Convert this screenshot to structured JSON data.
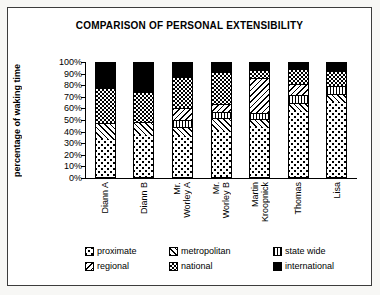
{
  "chart_data": {
    "type": "bar",
    "stacked": true,
    "title": "COMPARISON OF PERSONAL EXTENSIBILITY",
    "ylabel": "percentage of waking time",
    "ylim": [
      0,
      100
    ],
    "ytick_labels": [
      "0%",
      "10%",
      "20%",
      "30%",
      "40%",
      "50%",
      "60%",
      "70%",
      "80%",
      "90%",
      "100%"
    ],
    "grid": false,
    "legend_position": "bottom",
    "legend_columns": 3,
    "categories": [
      "Diann A",
      "Diann B",
      "Mr. Worley A",
      "Mr. Worley B",
      "Martin Kroopnick",
      "Thomas",
      "Lisa"
    ],
    "category_display": [
      "Diann A",
      "Diann B",
      "Mr.\nWorley A",
      "Mr.\nWorley B",
      "Martin\nKroopnick",
      "Thomas",
      "Lisa"
    ],
    "series": [
      {
        "name": "proximate",
        "pattern": "dots",
        "values": [
          33,
          37,
          36,
          40,
          44,
          58,
          66
        ]
      },
      {
        "name": "metropolitan",
        "pattern": "backslash-hatch",
        "values": [
          14,
          11,
          8,
          12,
          7,
          7,
          7
        ]
      },
      {
        "name": "state wide",
        "pattern": "vertical-lines",
        "values": [
          0,
          0,
          6,
          5,
          5,
          7,
          7
        ]
      },
      {
        "name": "regional",
        "pattern": "slash-hatch",
        "values": [
          0,
          0,
          11,
          7,
          31,
          10,
          0
        ]
      },
      {
        "name": "national",
        "pattern": "checker",
        "values": [
          31,
          27,
          27,
          28,
          7,
          13,
          13
        ]
      },
      {
        "name": "international",
        "pattern": "solid-black",
        "values": [
          22,
          25,
          12,
          8,
          6,
          5,
          7
        ]
      }
    ],
    "colors": {
      "foreground": "#000000",
      "background": "#ffffff"
    }
  }
}
